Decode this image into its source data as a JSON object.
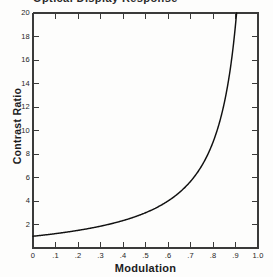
{
  "figure": {
    "caption_remnant": "Optical Display Response",
    "background_color": "#fdfdfc",
    "axis_color": "#3a3a3a",
    "curve_color": "#111111"
  },
  "chart_data": {
    "type": "line",
    "title": "",
    "xlabel": "Modulation",
    "ylabel": "Contrast Ratio",
    "xlim": [
      0,
      1.0
    ],
    "ylim": [
      0,
      20
    ],
    "grid": false,
    "legend": null,
    "x_tick_labels": [
      "0",
      ".1",
      ".2",
      ".3",
      ".4",
      ".5",
      ".6",
      ".7",
      ".8",
      ".9",
      "1.0"
    ],
    "x_tick_values": [
      0,
      0.1,
      0.2,
      0.3,
      0.4,
      0.5,
      0.6,
      0.7,
      0.8,
      0.9,
      1.0
    ],
    "y_tick_labels": [
      "2",
      "4",
      "6",
      "8",
      "10",
      "12",
      "14",
      "16",
      "18",
      "20"
    ],
    "y_tick_values": [
      2,
      4,
      6,
      8,
      10,
      12,
      14,
      16,
      18,
      20
    ],
    "relation": "CR = (1 + m) / (1 - m)",
    "series": [
      {
        "name": "Contrast Ratio vs Modulation",
        "x": [
          0.0,
          0.05,
          0.1,
          0.15,
          0.2,
          0.25,
          0.3,
          0.35,
          0.4,
          0.45,
          0.5,
          0.55,
          0.6,
          0.65,
          0.7,
          0.75,
          0.8,
          0.82,
          0.84,
          0.86,
          0.88,
          0.9,
          0.905
        ],
        "values": [
          1.0,
          1.11,
          1.22,
          1.35,
          1.5,
          1.67,
          1.86,
          2.08,
          2.33,
          2.64,
          3.0,
          3.44,
          4.0,
          4.71,
          5.67,
          7.0,
          9.0,
          10.11,
          11.5,
          13.29,
          15.67,
          19.0,
          20.0
        ]
      }
    ]
  }
}
